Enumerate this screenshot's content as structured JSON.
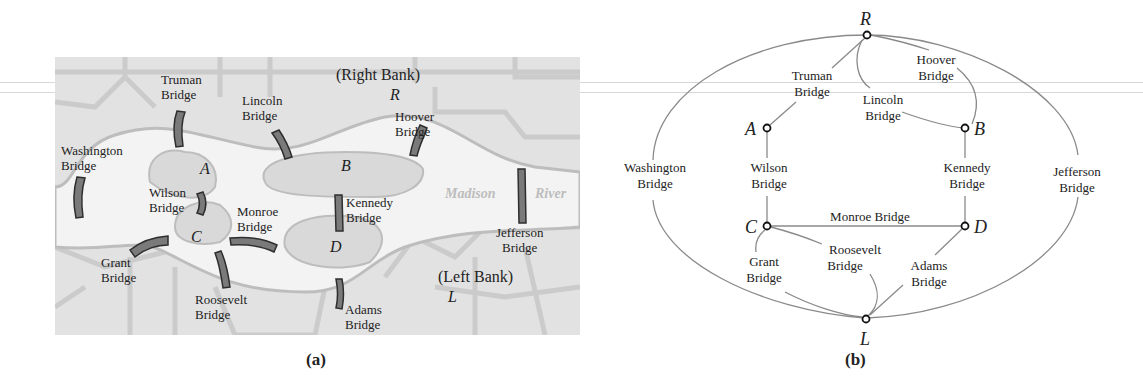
{
  "figure": {
    "panel_a": {
      "caption": "(a)",
      "title": "Map of the Madison River bridges",
      "banks": {
        "right": {
          "label": "(Right Bank)",
          "letter": "R"
        },
        "left": {
          "label": "(Left Bank)",
          "letter": "L"
        }
      },
      "river_label": {
        "word1": "Madison",
        "word2": "River"
      },
      "islands": [
        {
          "id": "A",
          "letter": "A"
        },
        {
          "id": "B",
          "letter": "B"
        },
        {
          "id": "C",
          "letter": "C"
        },
        {
          "id": "D",
          "letter": "D"
        }
      ],
      "bridges": [
        {
          "name": "truman",
          "line1": "Truman",
          "line2": "Bridge"
        },
        {
          "name": "lincoln",
          "line1": "Lincoln",
          "line2": "Bridge"
        },
        {
          "name": "hoover",
          "line1": "Hoover",
          "line2": "Bridge"
        },
        {
          "name": "washington",
          "line1": "Washington",
          "line2": "Bridge"
        },
        {
          "name": "wilson",
          "line1": "Wilson",
          "line2": "Bridge"
        },
        {
          "name": "kennedy",
          "line1": "Kennedy",
          "line2": "Bridge"
        },
        {
          "name": "monroe",
          "line1": "Monroe",
          "line2": "Bridge"
        },
        {
          "name": "jefferson",
          "line1": "Jefferson",
          "line2": "Bridge"
        },
        {
          "name": "grant",
          "line1": "Grant",
          "line2": "Bridge"
        },
        {
          "name": "roosevelt",
          "line1": "Roosevelt",
          "line2": "Bridge"
        },
        {
          "name": "adams",
          "line1": "Adams",
          "line2": "Bridge"
        }
      ]
    },
    "panel_b": {
      "caption": "(b)",
      "title": "Graph model of the bridges",
      "vertices": [
        {
          "id": "R",
          "label": "R"
        },
        {
          "id": "A",
          "label": "A"
        },
        {
          "id": "B",
          "label": "B"
        },
        {
          "id": "C",
          "label": "C"
        },
        {
          "id": "D",
          "label": "D"
        },
        {
          "id": "L",
          "label": "L"
        }
      ],
      "edges": [
        {
          "from": "R",
          "to": "A",
          "line1": "Truman",
          "line2": "Bridge"
        },
        {
          "from": "R",
          "to": "B",
          "line1": "Lincoln",
          "line2": "Bridge"
        },
        {
          "from": "R",
          "to": "B",
          "line1": "Hoover",
          "line2": "Bridge"
        },
        {
          "from": "R",
          "to": "L",
          "line1": "Washington",
          "line2": "Bridge"
        },
        {
          "from": "R",
          "to": "L",
          "line1": "Jefferson",
          "line2": "Bridge"
        },
        {
          "from": "A",
          "to": "C",
          "line1": "Wilson",
          "line2": "Bridge"
        },
        {
          "from": "B",
          "to": "D",
          "line1": "Kennedy",
          "line2": "Bridge"
        },
        {
          "from": "C",
          "to": "D",
          "line1": "Monroe Bridge",
          "line2": ""
        },
        {
          "from": "C",
          "to": "L",
          "line1": "Grant",
          "line2": "Bridge"
        },
        {
          "from": "C",
          "to": "L",
          "line1": "Roosevelt",
          "line2": "Bridge"
        },
        {
          "from": "D",
          "to": "L",
          "line1": "Adams",
          "line2": "Bridge"
        }
      ]
    }
  },
  "colors": {
    "map_bg": "#e4e4e4",
    "river": "#f2f2f2",
    "road": "#c8c8c8",
    "bridge_fill": "#7a7a7a",
    "bridge_stroke": "#2e2e2e",
    "edge": "#8a8a8a",
    "text": "#222222"
  }
}
